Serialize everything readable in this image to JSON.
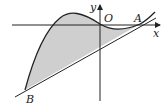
{
  "diagram": {
    "type": "function-graph",
    "labels": {
      "y_axis": "y",
      "x_axis": "x",
      "origin": "O",
      "point_a": "A",
      "point_b": "B"
    },
    "colors": {
      "stroke": "#222222",
      "shade": "#cfcfcf",
      "background": "#ffffff"
    }
  }
}
